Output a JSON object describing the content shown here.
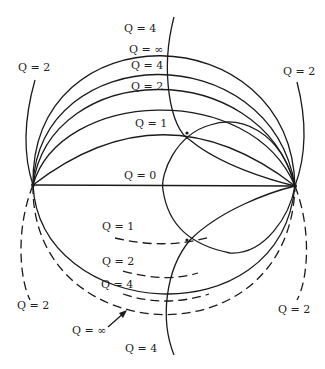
{
  "diagram": {
    "colors": {
      "line": "#1a1a1a",
      "background": "#ffffff"
    },
    "upper_labels": [
      {
        "id": "q4-outer",
        "text": "Q = 4"
      },
      {
        "id": "q-inf",
        "text": "Q = ∞"
      },
      {
        "id": "q4",
        "text": "Q = 4"
      },
      {
        "id": "q2",
        "text": "Q = 2"
      },
      {
        "id": "q1",
        "text": "Q = 1"
      },
      {
        "id": "q0",
        "text": "Q = 0"
      }
    ],
    "side_labels": [
      {
        "id": "left-upper",
        "text": "Q = 2"
      },
      {
        "id": "right-upper",
        "text": "Q = 2"
      },
      {
        "id": "left-lower",
        "text": "Q = 2"
      },
      {
        "id": "right-lower",
        "text": "Q = 2"
      }
    ],
    "lower_labels": [
      {
        "id": "q1-lower",
        "text": "Q = 1"
      },
      {
        "id": "q2-lower",
        "text": "Q = 2"
      },
      {
        "id": "q4-lower",
        "text": "Q = 4"
      },
      {
        "id": "q-inf-lower",
        "text": "Q = ∞"
      },
      {
        "id": "q4-bottom",
        "text": "Q = 4"
      }
    ]
  }
}
